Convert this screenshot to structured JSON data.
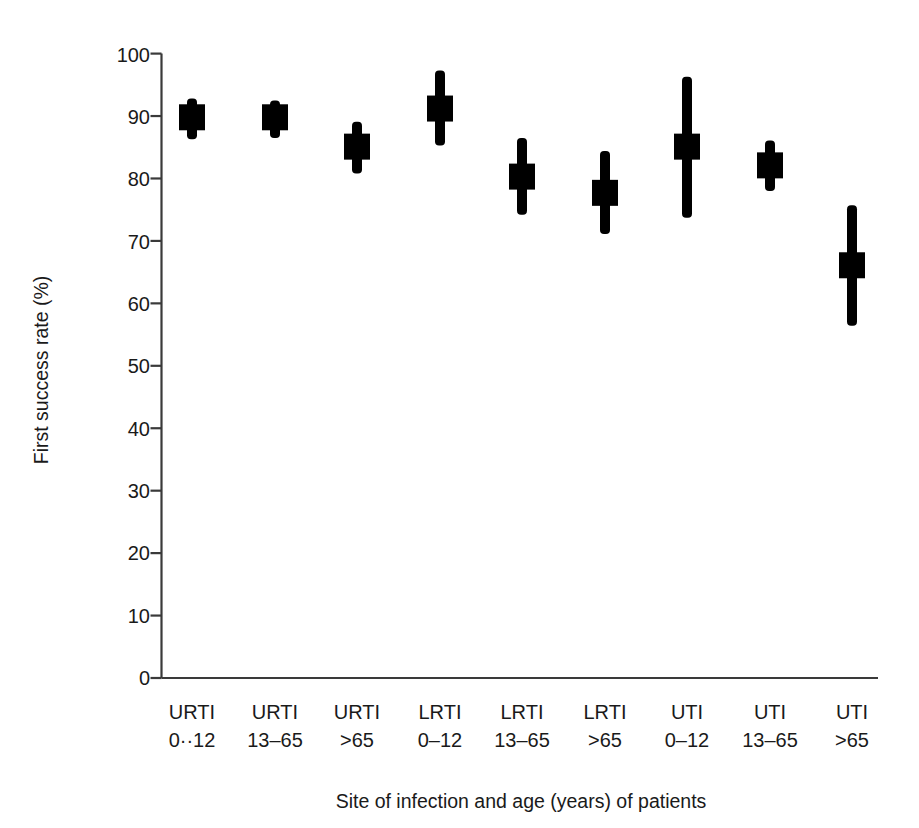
{
  "chart_data": {
    "type": "box",
    "title": "",
    "xlabel": "Site of infection and age (years) of patients",
    "ylabel": "First success rate (%)",
    "ylim": [
      0,
      100
    ],
    "yticks": [
      0,
      10,
      20,
      30,
      40,
      50,
      60,
      70,
      80,
      90,
      100
    ],
    "ytick_labels": [
      "0",
      "10",
      "20",
      "30",
      "40",
      "50",
      "60",
      "70",
      "80",
      "90",
      "100"
    ],
    "grid": false,
    "legend": "none",
    "categories": [
      {
        "site": "URTI",
        "age": "0··12"
      },
      {
        "site": "URTI",
        "age": "13–65"
      },
      {
        "site": "URTI",
        "age": ">65"
      },
      {
        "site": "LRTI",
        "age": "0–12"
      },
      {
        "site": "LRTI",
        "age": "13–65"
      },
      {
        "site": "LRTI",
        "age": ">65"
      },
      {
        "site": "UTI",
        "age": "0–12"
      },
      {
        "site": "UTI",
        "age": "13–65"
      },
      {
        "site": "UTI",
        "age": ">65"
      }
    ],
    "series": [
      {
        "name": "First success rate",
        "points": [
          {
            "label": "URTI 0-12",
            "value": 89.8,
            "low": 86.3,
            "high": 92.8
          },
          {
            "label": "URTI 13-65",
            "value": 89.8,
            "low": 86.5,
            "high": 92.5
          },
          {
            "label": "URTI >65",
            "value": 85.1,
            "low": 80.8,
            "high": 89.1
          },
          {
            "label": "LRTI 0-12",
            "value": 91.2,
            "low": 85.3,
            "high": 97.3
          },
          {
            "label": "LRTI 13-65",
            "value": 80.3,
            "low": 74.2,
            "high": 86.5
          },
          {
            "label": "LRTI >65",
            "value": 77.7,
            "low": 71.1,
            "high": 84.4
          },
          {
            "label": "UTI 0-12",
            "value": 85.1,
            "low": 73.7,
            "high": 96.3
          },
          {
            "label": "UTI 13-65",
            "value": 82.1,
            "low": 78.0,
            "high": 86.1
          },
          {
            "label": "UTI >65",
            "value": 66.1,
            "low": 56.4,
            "high": 75.7
          }
        ]
      }
    ],
    "marker": {
      "style": "square-with-range-bar",
      "color": "#000000"
    }
  },
  "axes": {
    "y_axis_name": "First success rate (%)",
    "x_axis_name": "Site of infection and age (years) of patients"
  }
}
